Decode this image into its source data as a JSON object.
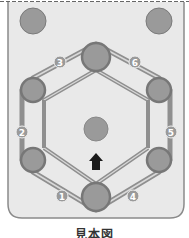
{
  "diagram": {
    "caption": "見本図",
    "colors": {
      "panel_fill": "#e9e9e9",
      "panel_stroke": "#8a8a8a",
      "pulley_fill": "#9a9a9a",
      "pulley_ring": "#777777",
      "belt": "#8f8f8f",
      "belt_inner": "#d9d9d9",
      "badge_fill": "#9a9a9a",
      "badge_text": "#ffffff",
      "arrow": "#1a1a1a"
    },
    "badges": [
      {
        "label": "1"
      },
      {
        "label": "2"
      },
      {
        "label": "3"
      },
      {
        "label": "4"
      },
      {
        "label": "5"
      },
      {
        "label": "6"
      }
    ],
    "arrow_direction": "up"
  }
}
